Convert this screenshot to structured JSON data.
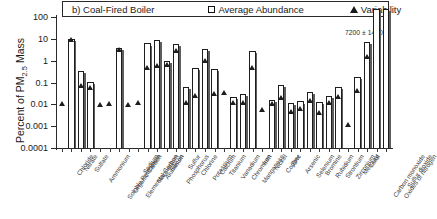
{
  "legend": {
    "panel_label": "b) Coal-Fired Boiler",
    "series_abundance": "Average Abundance",
    "series_variability": "Variability",
    "abundance_marker": "open-square",
    "variability_marker": "filled-triangle"
  },
  "axes": {
    "ylabel_pre": "Percent of PM",
    "ylabel_sub": "2.5",
    "ylabel_post": " Mass",
    "yticks": [
      "100",
      "10",
      "1",
      "0.1",
      "0.01",
      "0.001",
      "0.0001"
    ]
  },
  "annotation": {
    "offscale": "7200 ± 1400"
  },
  "chart_data": {
    "type": "bar",
    "title": "b) Coal-Fired Boiler",
    "xlabel": "",
    "ylabel": "Percent of PM2.5 Mass",
    "yscale": "log",
    "ylim": [
      0.0001,
      100
    ],
    "ytick_values": [
      100,
      10,
      1,
      0.1,
      0.01,
      0.001,
      0.0001
    ],
    "grid": false,
    "legend_position": "top",
    "categories": [
      "Chloride",
      "Nitrate",
      "Sulfate",
      "Ammonium",
      "Soluble Potassium",
      "Organic Carbon",
      "Elemental Carbon",
      "Sodium",
      "Magnesium",
      "Aluminum",
      "Silicon",
      "Phosphorus",
      "Sulfur",
      "Chlorine",
      "Potassium",
      "Calcium",
      "Titanium",
      "Vanadium",
      "Chromium",
      "Manganese",
      "Iron",
      "Nickel",
      "Copper",
      "Zinc",
      "Arsenic",
      "Selenium",
      "Bromine",
      "Rubidium",
      "Strontium",
      "Zirconium",
      "Mercury",
      "Lead",
      "Carbon monoxide",
      "Oxides of nitrogen",
      "Sulfur dioxide"
    ],
    "series": [
      {
        "name": "Average Abundance",
        "values": [
          null,
          10.0,
          0.35,
          0.11,
          null,
          null,
          3.9,
          null,
          null,
          6.2,
          9.2,
          1.0,
          5.7,
          0.065,
          0.45,
          3.5,
          0.42,
          null,
          0.022,
          0.029,
          2.9,
          null,
          0.016,
          0.075,
          0.012,
          0.0135,
          0.037,
          0.0125,
          0.024,
          0.062,
          null,
          0.18,
          7.0,
          7200,
          5000
        ]
      },
      {
        "name": "Variability",
        "values": [
          0.011,
          9.6,
          0.072,
          0.058,
          0.0095,
          0.0105,
          3.1,
          0.0095,
          0.0115,
          0.5,
          0.56,
          0.68,
          2.8,
          0.0125,
          0.026,
          1.05,
          0.03,
          0.034,
          0.0115,
          0.012,
          0.5,
          0.0055,
          0.0105,
          0.02,
          0.0048,
          0.0062,
          0.014,
          0.0042,
          0.0115,
          0.022,
          0.0012,
          0.04,
          1.5,
          null,
          null
        ]
      }
    ],
    "offscale_note": {
      "applies_to": "Oxides of nitrogen",
      "value": "7200 ± 1400"
    }
  }
}
